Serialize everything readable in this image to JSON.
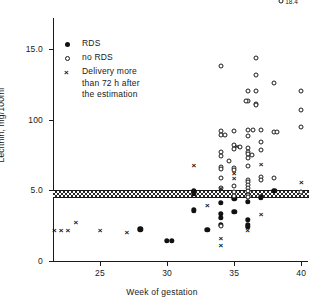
{
  "chart_data": {
    "type": "scatter",
    "title": "",
    "xlabel": "Week of gestation",
    "ylabel": "Lecithin, mg/100ml",
    "xlim": [
      21.5,
      40.5
    ],
    "ylim": [
      0,
      17.2
    ],
    "xticks": [
      25,
      30,
      35,
      40
    ],
    "xtick_labels": [
      "25",
      "30",
      "35",
      "40"
    ],
    "yticks": [
      0,
      5.0,
      10.0,
      15.0
    ],
    "ytick_labels": [
      "0",
      "5.0",
      "100",
      "15.0"
    ],
    "grid": false,
    "legend_position": "upper-left",
    "reference_band": {
      "label": "",
      "y_low": 4.45,
      "y_high": 5.05
    },
    "series": [
      {
        "name": "RDS",
        "marker": "filled-circle",
        "points": [
          [
            28.0,
            2.25
          ],
          [
            30.0,
            1.45
          ],
          [
            30.35,
            1.45
          ],
          [
            32.0,
            4.95
          ],
          [
            32.0,
            4.8
          ],
          [
            32.0,
            3.6
          ],
          [
            33.0,
            2.2
          ],
          [
            34.0,
            4.1
          ],
          [
            34.0,
            3.35
          ],
          [
            34.0,
            3.05
          ],
          [
            34.0,
            2.55
          ],
          [
            35.0,
            4.45
          ],
          [
            35.0,
            3.5
          ],
          [
            36.0,
            4.2
          ],
          [
            36.0,
            2.9
          ],
          [
            36.0,
            2.55
          ],
          [
            36.0,
            2.4
          ],
          [
            37.0,
            4.5
          ],
          [
            38.0,
            4.95
          ]
        ]
      },
      {
        "name": "no RDS",
        "marker": "open-circle",
        "points": [
          [
            34.0,
            13.8
          ],
          [
            34.0,
            6.65
          ],
          [
            34.0,
            6.5
          ],
          [
            34.0,
            9.2
          ],
          [
            34.0,
            8.9
          ],
          [
            34.3,
            8.9
          ],
          [
            34.0,
            7.7
          ],
          [
            34.0,
            7.4
          ],
          [
            34.0,
            5.9
          ],
          [
            34.0,
            5.2
          ],
          [
            34.0,
            2.45
          ],
          [
            34.6,
            7.1
          ],
          [
            35.0,
            9.2
          ],
          [
            35.0,
            8.2
          ],
          [
            35.0,
            7.9
          ],
          [
            35.0,
            6.55
          ],
          [
            35.0,
            6.45
          ],
          [
            35.0,
            5.3
          ],
          [
            35.0,
            4.9
          ],
          [
            35.0,
            4.6
          ],
          [
            35.4,
            8.05
          ],
          [
            36.0,
            12.0
          ],
          [
            36.0,
            11.3
          ],
          [
            36.0,
            9.3
          ],
          [
            36.0,
            8.85
          ],
          [
            36.0,
            8.0
          ],
          [
            36.0,
            7.7
          ],
          [
            36.0,
            7.55
          ],
          [
            36.0,
            7.3
          ],
          [
            36.0,
            6.7
          ],
          [
            36.0,
            5.75
          ],
          [
            36.0,
            5.6
          ],
          [
            36.0,
            5.35
          ],
          [
            36.0,
            5.15
          ],
          [
            36.0,
            4.95
          ],
          [
            36.0,
            4.7
          ],
          [
            36.0,
            4.5
          ],
          [
            36.3,
            7.5
          ],
          [
            36.4,
            9.25
          ],
          [
            36.6,
            14.35
          ],
          [
            36.6,
            13.2
          ],
          [
            36.6,
            12.05
          ],
          [
            36.6,
            11.1
          ],
          [
            36.6,
            11.05
          ],
          [
            35.9,
            11.35
          ],
          [
            37.0,
            9.25
          ],
          [
            37.0,
            8.45
          ],
          [
            37.0,
            7.85
          ],
          [
            37.0,
            5.95
          ],
          [
            37.0,
            5.75
          ],
          [
            38.0,
            12.6
          ],
          [
            38.0,
            9.15
          ],
          [
            38.2,
            9.15
          ],
          [
            38.0,
            5.85
          ],
          [
            40.0,
            12.05
          ],
          [
            40.0,
            10.7
          ],
          [
            40.0,
            9.45
          ],
          [
            40.0,
            4.85
          ],
          [
            36.2,
            23.4
          ],
          [
            36.3,
            22.0
          ],
          [
            37.0,
            21.0
          ],
          [
            38.5,
            18.4
          ]
        ]
      },
      {
        "name": "Delivery more than 72 h after the estimation",
        "marker": "cross",
        "points": [
          [
            21.6,
            2.2
          ],
          [
            22.1,
            2.2
          ],
          [
            22.6,
            2.2
          ],
          [
            23.2,
            2.75
          ],
          [
            25.0,
            2.2
          ],
          [
            27.0,
            2.05
          ],
          [
            28.0,
            2.25
          ],
          [
            32.0,
            6.8
          ],
          [
            33.0,
            3.95
          ],
          [
            34.0,
            5.15
          ],
          [
            34.0,
            1.65
          ],
          [
            34.0,
            1.15
          ],
          [
            35.0,
            6.2
          ],
          [
            35.0,
            5.9
          ],
          [
            35.2,
            8.15
          ],
          [
            36.0,
            2.95
          ],
          [
            36.0,
            2.45
          ],
          [
            36.0,
            2.2
          ],
          [
            37.0,
            6.85
          ],
          [
            37.0,
            3.35
          ],
          [
            40.0,
            5.6
          ]
        ]
      }
    ],
    "point_labels": [
      {
        "text": "23.4",
        "x": 36.2,
        "y": 23.4
      },
      {
        "text": "22.0",
        "x": 36.3,
        "y": 22.0
      },
      {
        "text": "18.4",
        "x": 38.5,
        "y": 18.4
      }
    ]
  },
  "legend": {
    "items": [
      {
        "marker": "filled-circle",
        "label": "RDS",
        "label_line2": ""
      },
      {
        "marker": "open-circle",
        "label": "no RDS",
        "label_line2": ""
      },
      {
        "marker": "cross",
        "label": "Delivery more",
        "label_line2": "than 72 h after",
        "label_line3": "the estimation"
      }
    ]
  }
}
